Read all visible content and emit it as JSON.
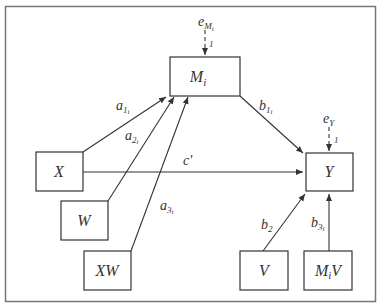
{
  "diagram": {
    "type": "moderated-mediation path diagram",
    "nodes": {
      "M": {
        "label": "M",
        "sub": "i"
      },
      "X": {
        "label": "X"
      },
      "Y": {
        "label": "Y"
      },
      "W": {
        "label": "W"
      },
      "XW": {
        "label": "XW"
      },
      "V": {
        "label": "V"
      },
      "MiV": {
        "label": "M",
        "sub": "i",
        "suffix": "V"
      }
    },
    "errors": {
      "eM": {
        "label": "e",
        "sub": "M",
        "subsub": "i",
        "weight": "1"
      },
      "eY": {
        "label": "e",
        "sub": "Y",
        "weight": "1"
      }
    },
    "paths": {
      "a1": {
        "label": "a",
        "sub": "1",
        "subsub": "i",
        "from": "X",
        "to": "M"
      },
      "a2": {
        "label": "a",
        "sub": "2",
        "subsub": "i",
        "from": "W",
        "to": "M"
      },
      "a3": {
        "label": "a",
        "sub": "3",
        "subsub": "i",
        "from": "XW",
        "to": "M"
      },
      "b1": {
        "label": "b",
        "sub": "1",
        "subsub": "i",
        "from": "M",
        "to": "Y"
      },
      "c": {
        "label": "c′",
        "from": "X",
        "to": "Y"
      },
      "b2": {
        "label": "b",
        "sub": "2",
        "from": "V",
        "to": "Y"
      },
      "b3": {
        "label": "b",
        "sub": "3",
        "subsub": "i",
        "from": "MiV",
        "to": "Y"
      }
    },
    "colors": {
      "stroke": "#333333",
      "frame": "#777777",
      "background": "#ffffff"
    }
  }
}
